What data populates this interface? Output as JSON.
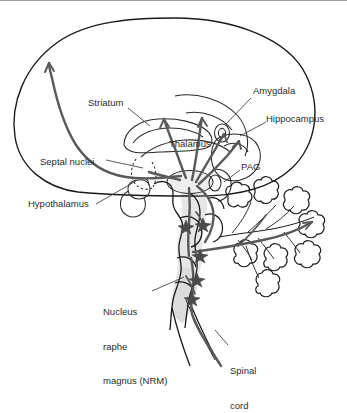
{
  "figure": {
    "background_color": "#ffffff",
    "outline_color": "#1a1a1a",
    "pathway_color": "#595959",
    "shading_color": "#e3e3e3",
    "leader_color": "#3a3a3a",
    "text_color": "#2b2b2b",
    "width": 347,
    "height": 391
  },
  "labels": [
    {
      "id": "striatum",
      "text": "Striatum",
      "x": 88,
      "y": 102
    },
    {
      "id": "amygdala",
      "text": "Amygdala",
      "x": 253,
      "y": 90
    },
    {
      "id": "hippocampus",
      "text": "Hippocampus",
      "x": 268,
      "y": 118
    },
    {
      "id": "thalamus",
      "text": "Thalamus",
      "x": 169,
      "y": 143
    },
    {
      "id": "pag",
      "text": "PAG",
      "x": 241,
      "y": 166
    },
    {
      "id": "septal-nuclei",
      "text": "Septal nuclei",
      "x": 40,
      "y": 161
    },
    {
      "id": "hypothalamus",
      "text": "Hypothalamus",
      "x": 28,
      "y": 203
    }
  ],
  "multiline_labels": [
    {
      "id": "nucleus-raphe-magnus",
      "lines": [
        "Nucleus",
        "raphe",
        "magnus (NRM)"
      ],
      "x": 103,
      "y": 288
    },
    {
      "id": "spinal-cord",
      "lines": [
        "Spinal",
        "cord"
      ],
      "x": 230,
      "y": 347
    }
  ],
  "structures": [
    {
      "id": "cerebral-cortex",
      "name": "Cerebral cortex outline"
    },
    {
      "id": "striatum-body",
      "name": "Striatum (caudate/putamen) outline"
    },
    {
      "id": "thalamus-body",
      "name": "Thalamus outline"
    },
    {
      "id": "amygdala-body",
      "name": "Amygdala outline"
    },
    {
      "id": "hippocampus-body",
      "name": "Hippocampus outline"
    },
    {
      "id": "septal-body",
      "name": "Septal nuclei (dashed) outline"
    },
    {
      "id": "hypothalamus-body",
      "name": "Hypothalamus and pituitary outline"
    },
    {
      "id": "pag-body",
      "name": "Periaqueductal gray outline"
    },
    {
      "id": "brainstem-body",
      "name": "Brainstem (midbrain, pons, medulla) shaded"
    },
    {
      "id": "cerebellum-body",
      "name": "Cerebellum with folia"
    },
    {
      "id": "spinal-cord-body",
      "name": "Spinal cord"
    },
    {
      "id": "nrm-body",
      "name": "Nucleus raphe magnus shaded region"
    }
  ],
  "pathways": [
    {
      "id": "cortical-tract",
      "name": "Ascending cortical projection to frontal cortex"
    },
    {
      "id": "striatal-tract",
      "name": "Projection into striatum"
    },
    {
      "id": "thalamic-tract",
      "name": "Thalamic projection"
    },
    {
      "id": "amygdala-tract",
      "name": "Amygdala projection"
    },
    {
      "id": "hippocampal-tract",
      "name": "Hippocampal projection"
    },
    {
      "id": "pag-tract",
      "name": "Periaqueductal gray descending tract"
    },
    {
      "id": "cerebellar-tract",
      "name": "Cerebellar projection"
    },
    {
      "id": "nrm-descending",
      "name": "Descending NRM tract to spinal cord"
    }
  ],
  "nuclei_markers": [
    {
      "id": "marker-midbrain-left",
      "x": 186,
      "y": 226
    },
    {
      "id": "marker-midbrain-right",
      "x": 203,
      "y": 224
    },
    {
      "id": "marker-pons",
      "x": 200,
      "y": 255
    },
    {
      "id": "marker-nrm-upper",
      "x": 197,
      "y": 279
    },
    {
      "id": "marker-nrm-lower",
      "x": 192,
      "y": 298
    }
  ]
}
